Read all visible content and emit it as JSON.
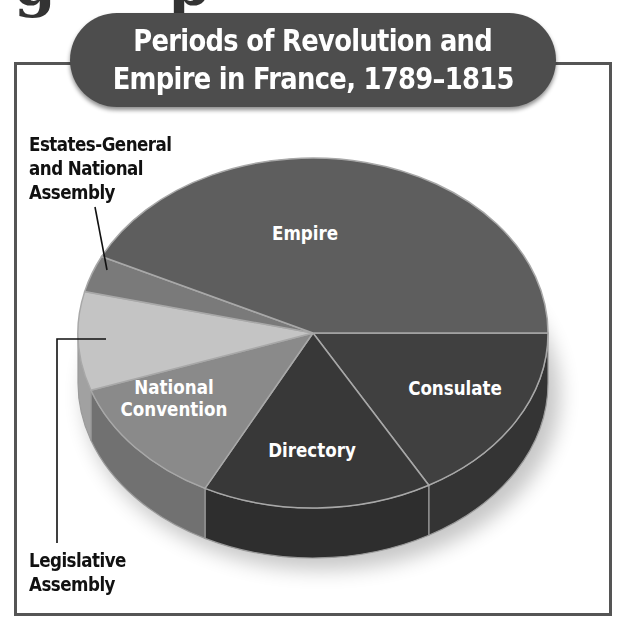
{
  "chart_data": {
    "type": "pie",
    "style": "3d",
    "title": "Periods of Revolution and Empire in France, 1789–1815",
    "title_lines": [
      "Periods of Revolution and",
      "Empire in France, 1789–1815"
    ],
    "categories": [
      "Empire",
      "Consulate",
      "Directory",
      "National Convention",
      "Legislative Assembly",
      "Estates-General and National Assembly"
    ],
    "values": [
      42.8,
      16.8,
      15.8,
      12.1,
      9.1,
      3.4
    ],
    "unit": "approx. % of period (estimated from slice angles)",
    "legend": "none (direct labels)",
    "colors": {
      "Empire": "#5e5e5e",
      "Consulate": "#404040",
      "Directory": "#383838",
      "National Convention": "#8a8a8a",
      "Legislative Assembly": "#c4c4c4",
      "Estates-General and National Assembly": "#7a7a7a"
    },
    "inside_labels": {
      "Empire": [
        "Empire"
      ],
      "Consulate": [
        "Consulate"
      ],
      "Directory": [
        "Directory"
      ],
      "National Convention": [
        "National",
        "Convention"
      ]
    },
    "outside_labels": {
      "Estates-General and National Assembly": [
        "Estates-General",
        "and National",
        "Assembly"
      ],
      "Legislative Assembly": [
        "Legislative",
        "Assembly"
      ]
    }
  },
  "cropped_heading_fragment": [
    "g",
    "p"
  ]
}
